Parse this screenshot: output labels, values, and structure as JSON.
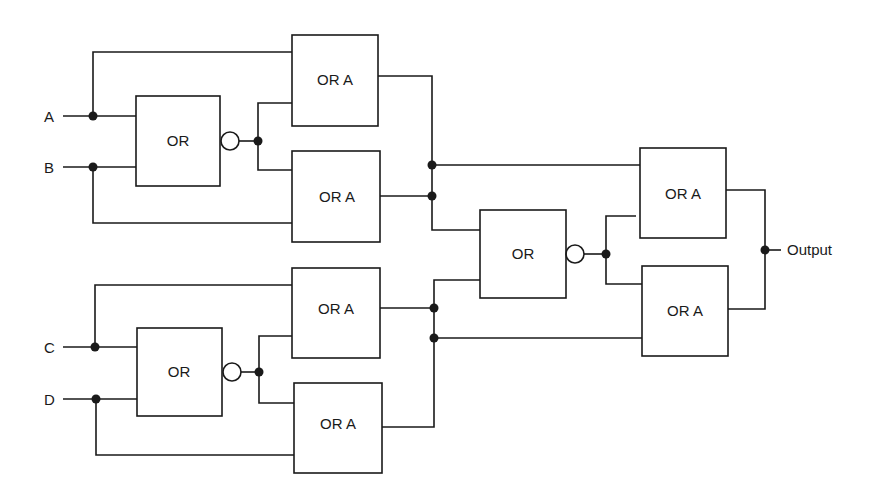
{
  "diagram": {
    "type": "logic-circuit",
    "inputs": [
      {
        "id": "A",
        "label": "A"
      },
      {
        "id": "B",
        "label": "B"
      },
      {
        "id": "C",
        "label": "C"
      },
      {
        "id": "D",
        "label": "D"
      }
    ],
    "output": {
      "label": "Output"
    },
    "gates": [
      {
        "id": "g1",
        "label": "OR"
      },
      {
        "id": "g2",
        "label": "OR A"
      },
      {
        "id": "g3",
        "label": "OR A"
      },
      {
        "id": "g4",
        "label": "OR"
      },
      {
        "id": "g5",
        "label": "OR A"
      },
      {
        "id": "g6",
        "label": "OR A"
      },
      {
        "id": "g7",
        "label": "OR"
      },
      {
        "id": "g8",
        "label": "OR A"
      },
      {
        "id": "g9",
        "label": "OR A"
      }
    ],
    "colors": {
      "line": "#1a1a1a",
      "background": "#ffffff"
    }
  }
}
